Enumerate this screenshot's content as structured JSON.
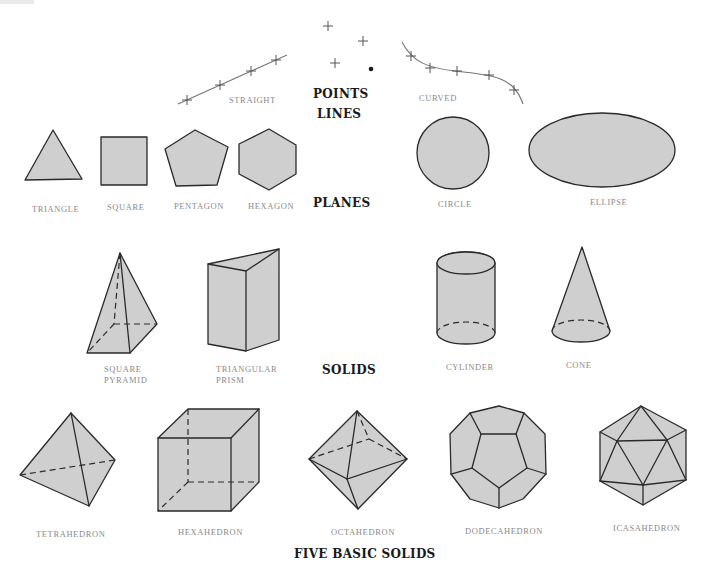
{
  "colors": {
    "shape_fill": "#cfcfcf",
    "outline": "#2a2a2a",
    "label_text": "#8a8a8a",
    "heading_text": "#1a1a1a"
  },
  "headings": {
    "points": "POINTS",
    "lines": "LINES",
    "planes": "PLANES",
    "solids": "SOLIDS",
    "five_basic_solids": "FIVE BASIC SOLIDS"
  },
  "lines": {
    "straight": "STRAIGHT",
    "curved": "CURVED"
  },
  "planes": [
    {
      "id": "triangle",
      "label": "TRIANGLE"
    },
    {
      "id": "square",
      "label": "SQUARE"
    },
    {
      "id": "pentagon",
      "label": "PENTAGON"
    },
    {
      "id": "hexagon",
      "label": "HEXAGON"
    },
    {
      "id": "circle",
      "label": "CIRCLE"
    },
    {
      "id": "ellipse",
      "label": "ELLIPSE"
    }
  ],
  "solids": [
    {
      "id": "square-pyramid",
      "label_line1": "SQUARE",
      "label_line2": "PYRAMID"
    },
    {
      "id": "triangular-prism",
      "label_line1": "TRIANGULAR",
      "label_line2": "PRISM"
    },
    {
      "id": "cylinder",
      "label_line1": "CYLINDER"
    },
    {
      "id": "cone",
      "label_line1": "CONE"
    }
  ],
  "basic_solids": [
    {
      "id": "tetrahedron",
      "label": "TETRAHEDRON"
    },
    {
      "id": "hexahedron",
      "label": "HEXAHEDRON"
    },
    {
      "id": "octahedron",
      "label": "OCTAHEDRON"
    },
    {
      "id": "dodecahedron",
      "label": "DODECAHEDRON"
    },
    {
      "id": "icosahedron",
      "label": "ICASAHEDRON"
    }
  ]
}
